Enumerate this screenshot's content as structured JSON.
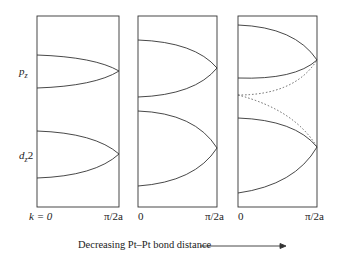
{
  "panels": [
    {
      "x_start_label": "k = 0",
      "x_end_label": "π/2a"
    },
    {
      "x_start_label": "0",
      "x_end_label": "π/2a"
    },
    {
      "x_start_label": "0",
      "x_end_label": "π/2a"
    }
  ],
  "bands": {
    "upper": "p",
    "upper_sub": "z",
    "lower": "d",
    "lower_sub": "z",
    "lower_suffix": "2"
  },
  "caption": "Decreasing Pt–Pt bond distance",
  "colors": {
    "line": "#333333",
    "dotted": "#555555"
  }
}
